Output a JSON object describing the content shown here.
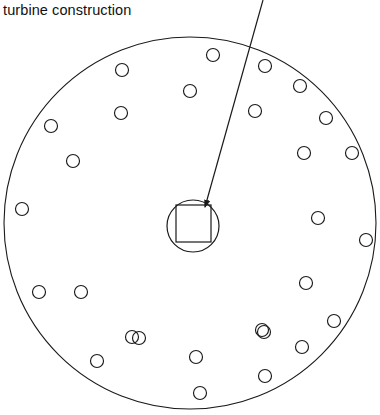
{
  "figure": {
    "caption_line1": "turbine",
    "caption_line2": "construction",
    "title": "turbine construction",
    "background_color": "#ffffff",
    "stroke_color": "#1a1a1a",
    "stroke_width": 1.1
  },
  "disc": {
    "name": "turbine-disc-outline",
    "center_x": 190,
    "center_y": 223,
    "radius": 186
  },
  "hub": {
    "name": "central-hub",
    "circle": {
      "center_x": 193,
      "center_y": 226,
      "radius": 26
    },
    "square": {
      "x": 176,
      "y": 205,
      "width": 35,
      "height": 37
    }
  },
  "leader": {
    "name": "leader-line",
    "x1": 263,
    "y1": 0,
    "x2": 205,
    "y2": 207,
    "arrowhead": "triangle"
  },
  "bolt_holes": {
    "radius": 6.5,
    "outer_ring_count": 16,
    "inner_ring_count": 12,
    "outer_ring": [
      [
        213,
        55
      ],
      [
        265,
        66
      ],
      [
        300,
        86
      ],
      [
        326,
        118
      ],
      [
        352,
        153
      ],
      [
        366,
        240
      ],
      [
        334,
        321
      ],
      [
        302,
        347
      ],
      [
        264,
        332
      ],
      [
        265,
        376
      ],
      [
        200,
        393
      ],
      [
        139,
        338
      ],
      [
        97,
        361
      ],
      [
        39,
        292
      ],
      [
        22,
        209
      ],
      [
        51,
        126
      ]
    ],
    "inner_ring": [
      [
        122,
        70
      ],
      [
        190,
        91
      ],
      [
        255,
        111
      ],
      [
        304,
        153
      ],
      [
        318,
        218
      ],
      [
        306,
        283
      ],
      [
        262,
        330
      ],
      [
        196,
        357
      ],
      [
        132,
        337
      ],
      [
        81,
        292
      ],
      [
        73,
        161
      ],
      [
        121,
        113
      ]
    ]
  }
}
